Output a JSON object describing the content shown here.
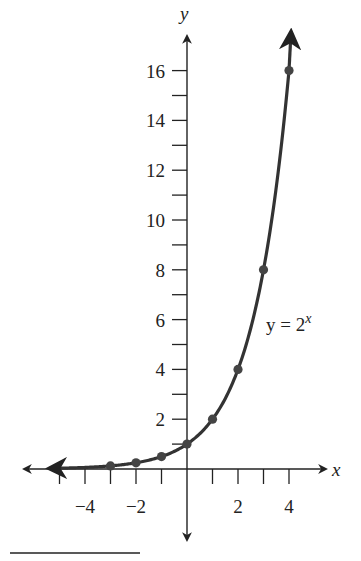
{
  "chart_data": {
    "type": "line",
    "title": "",
    "xlabel": "x",
    "ylabel": "y",
    "equation_label": {
      "lhs": "y = 2",
      "exp": "x"
    },
    "x_ticks": [
      -5,
      -4,
      -3,
      -2,
      -1,
      1,
      2,
      3,
      4
    ],
    "x_tick_labels": [
      "-4",
      "-2",
      "2",
      "4"
    ],
    "x_tick_label_values": [
      -4,
      -2,
      2,
      4
    ],
    "y_ticks": [
      1,
      2,
      3,
      4,
      5,
      6,
      7,
      8,
      9,
      10,
      11,
      12,
      13,
      14,
      15,
      16
    ],
    "y_tick_labels": [
      "2",
      "4",
      "6",
      "8",
      "10",
      "12",
      "14",
      "16"
    ],
    "y_tick_label_values": [
      2,
      4,
      6,
      8,
      10,
      12,
      14,
      16
    ],
    "xlim": [
      -6,
      5.5
    ],
    "ylim": [
      -3,
      17.5
    ],
    "grid": false,
    "series": [
      {
        "name": "y = 2^x",
        "function": "2^x",
        "points": [
          [
            -3,
            0.125
          ],
          [
            -2,
            0.25
          ],
          [
            -1,
            0.5
          ],
          [
            0,
            1
          ],
          [
            1,
            2
          ],
          [
            2,
            4
          ],
          [
            3,
            8
          ],
          [
            4,
            16
          ]
        ]
      }
    ]
  }
}
